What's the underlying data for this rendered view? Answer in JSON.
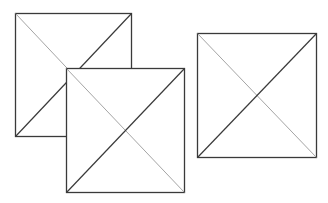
{
  "canvas": {
    "width": 328,
    "height": 203,
    "background": "#ffffff"
  },
  "colors": {
    "frame": "#3a3a3a",
    "diag_thick": "#3a3a3a",
    "diag_thin": "#9a9a9a",
    "fill": "#ffffff"
  },
  "squares": [
    {
      "id": "square-1",
      "x": 15,
      "y": 13,
      "w": 116,
      "h": 123
    },
    {
      "id": "square-2",
      "x": 66,
      "y": 68,
      "w": 118,
      "h": 124
    },
    {
      "id": "square-3",
      "x": 197,
      "y": 33,
      "w": 119,
      "h": 124
    }
  ]
}
